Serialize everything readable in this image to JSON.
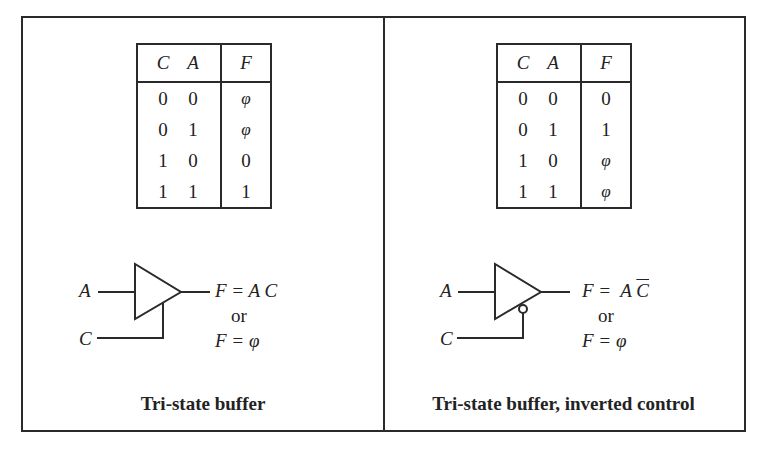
{
  "panels": [
    {
      "truth_table": {
        "headers": [
          "C",
          "A",
          "F"
        ],
        "rows": [
          [
            "0",
            "0",
            "φ"
          ],
          [
            "0",
            "1",
            "φ"
          ],
          [
            "1",
            "0",
            "0"
          ],
          [
            "1",
            "1",
            "1"
          ]
        ]
      },
      "symbol": {
        "input_label": "A",
        "control_label": "C",
        "control_inverted": false,
        "output_eq": "F = A C",
        "or_text": "or",
        "alt_eq": "F = φ"
      },
      "caption": "Tri-state buffer"
    },
    {
      "truth_table": {
        "headers": [
          "C",
          "A",
          "F"
        ],
        "rows": [
          [
            "0",
            "0",
            "0"
          ],
          [
            "0",
            "1",
            "1"
          ],
          [
            "1",
            "0",
            "φ"
          ],
          [
            "1",
            "1",
            "φ"
          ]
        ]
      },
      "symbol": {
        "input_label": "A",
        "control_label": "C",
        "control_inverted": true,
        "output_eq_prefix": "F =  A ",
        "output_eq_bar": "C",
        "or_text": "or",
        "alt_eq": "F = φ"
      },
      "caption": "Tri-state buffer, inverted control"
    }
  ],
  "colors": {
    "line": "#2a2a2a",
    "background": "#ffffff"
  }
}
